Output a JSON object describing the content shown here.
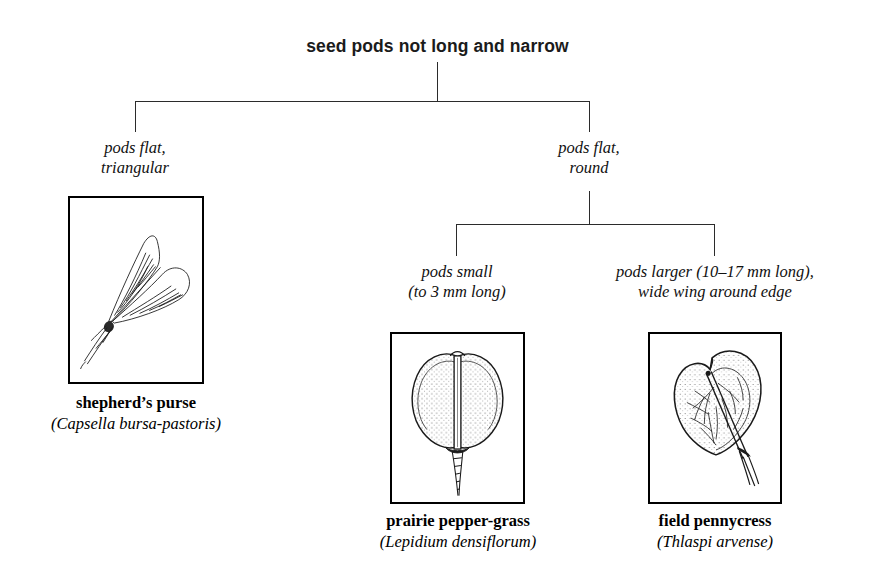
{
  "diagram": {
    "type": "dichotomous-key",
    "root": {
      "label": "seed pods not long and narrow"
    },
    "branches": [
      {
        "id": "pods-flat-triangular",
        "label": "pods flat,\ntriangular"
      },
      {
        "id": "pods-flat-round",
        "label": "pods flat,\nround"
      },
      {
        "id": "pods-small",
        "label": "pods small\n(to 3 mm long)"
      },
      {
        "id": "pods-larger",
        "label": "pods larger (10–17 mm long),\nwide wing around edge"
      }
    ],
    "species": [
      {
        "id": "shepherds-purse",
        "common_name": "shepherd’s purse",
        "scientific_name": "(Capsella bursa-pastoris)",
        "illustration": "triangular-seed-pod-illustration"
      },
      {
        "id": "prairie-pepper-grass",
        "common_name": "prairie pepper-grass",
        "scientific_name": "(Lepidium densiflorum)",
        "illustration": "round-notched-seed-pod-illustration"
      },
      {
        "id": "field-pennycress",
        "common_name": "field pennycress",
        "scientific_name": "(Thlaspi arvense)",
        "illustration": "winged-round-seed-pod-illustration"
      }
    ],
    "colors": {
      "background": "#ffffff",
      "ink": "#000000",
      "line": "#2b2b2b",
      "heading": "#1b1b1b"
    }
  }
}
